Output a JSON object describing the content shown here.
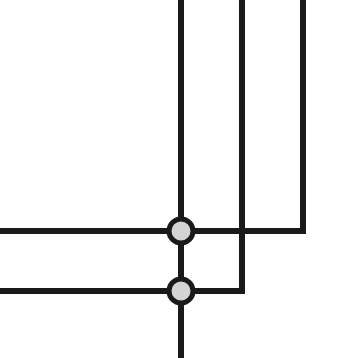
{
  "canvas": {
    "width": 357,
    "height": 358,
    "background_color": "#ffffff",
    "title": "Wire Junction Schematic"
  },
  "style": {
    "wire_color": "#1a1a1a",
    "wire_width": 6,
    "node_ring_color": "#1a1a1a",
    "node_fill_color": "#d4d4d4",
    "node_radius": 14.5,
    "node_ring_width": 5
  },
  "diagram": {
    "type": "orthogonal-wire-junction",
    "nodes": [
      {
        "id": "junction-upper",
        "label": "upper-junction-node",
        "cx": 181,
        "cy": 231,
        "r": 14.5,
        "fill": "#d4d4d4",
        "stroke": "#1a1a1a",
        "stroke_width": 5
      },
      {
        "id": "junction-lower",
        "label": "lower-junction-node",
        "cx": 181,
        "cy": 291,
        "r": 14.5,
        "fill": "#d4d4d4",
        "stroke": "#1a1a1a",
        "stroke_width": 5
      }
    ],
    "wires": [
      {
        "id": "wire-top-left-vertical",
        "label": "vertical-trunk-into-upper-junction",
        "points": "181,0 181,231"
      },
      {
        "id": "wire-top-middle-elbow",
        "label": "middle-vertical-elbow-to-lower-junction",
        "points": "242,0 242,291 181,291"
      },
      {
        "id": "wire-top-right-elbow",
        "label": "right-vertical-elbow-to-upper-junction",
        "points": "303,0 303,231 181,231"
      },
      {
        "id": "wire-left-upper-horizontal",
        "label": "left-edge-horizontal-into-upper-junction",
        "points": "0,231 181,231"
      },
      {
        "id": "wire-left-lower-horizontal",
        "label": "left-edge-horizontal-into-lower-junction",
        "points": "0,291 181,291"
      },
      {
        "id": "wire-between-junctions",
        "label": "vertical-link-upper-to-lower-junction",
        "points": "181,231 181,291"
      },
      {
        "id": "wire-bottom-vertical",
        "label": "vertical-trunk-out-of-lower-junction",
        "points": "181,291 181,358"
      }
    ]
  }
}
